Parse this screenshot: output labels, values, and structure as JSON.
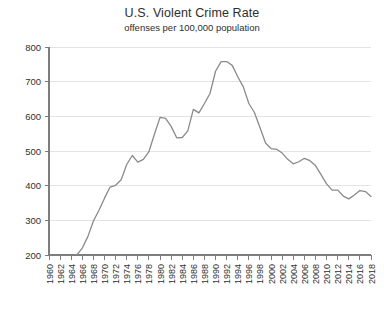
{
  "chart_data": {
    "type": "line",
    "title": "U.S. Violent Crime Rate",
    "subtitle": "offenses per 100,000 population",
    "xlabel": "",
    "ylabel": "",
    "ylim": [
      200,
      800
    ],
    "xlim": [
      1960,
      2018
    ],
    "grid": true,
    "legend": "none",
    "line_color": "#8a8a8a",
    "grid_color": "#e3e3e3",
    "axis_color": "#7d7d7d",
    "ytick_labels": [
      "800",
      "700",
      "600",
      "500",
      "400",
      "300",
      "200"
    ],
    "ytick_values": [
      800,
      700,
      600,
      500,
      400,
      300,
      200
    ],
    "xtick_labels": [
      "1960",
      "1962",
      "1964",
      "1966",
      "1968",
      "1970",
      "1972",
      "1974",
      "1976",
      "1978",
      "1980",
      "1982",
      "1984",
      "1986",
      "1988",
      "1990",
      "1992",
      "1994",
      "1996",
      "1998",
      "2000",
      "2002",
      "2004",
      "2006",
      "2008",
      "2010",
      "2012",
      "2014",
      "2016",
      "2018"
    ],
    "xtick_values": [
      1960,
      1962,
      1964,
      1966,
      1968,
      1970,
      1972,
      1974,
      1976,
      1978,
      1980,
      1982,
      1984,
      1986,
      1988,
      1990,
      1992,
      1994,
      1996,
      1998,
      2000,
      2002,
      2004,
      2006,
      2008,
      2010,
      2012,
      2014,
      2016,
      2018
    ],
    "x": [
      1960,
      1961,
      1962,
      1963,
      1964,
      1965,
      1966,
      1967,
      1968,
      1969,
      1970,
      1971,
      1972,
      1973,
      1974,
      1975,
      1976,
      1977,
      1978,
      1979,
      1980,
      1981,
      1982,
      1983,
      1984,
      1985,
      1986,
      1987,
      1988,
      1989,
      1990,
      1991,
      1992,
      1993,
      1994,
      1995,
      1996,
      1997,
      1998,
      1999,
      2000,
      2001,
      2002,
      2003,
      2004,
      2005,
      2006,
      2007,
      2008,
      2009,
      2010,
      2011,
      2012,
      2013,
      2014,
      2015,
      2016,
      2017,
      2018
    ],
    "values": [
      161,
      158,
      162,
      168,
      191,
      200,
      220,
      253,
      298,
      329,
      364,
      396,
      401,
      417,
      461,
      487,
      468,
      476,
      498,
      549,
      597,
      594,
      571,
      538,
      539,
      558,
      620,
      610,
      637,
      666,
      730,
      758,
      758,
      747,
      714,
      685,
      637,
      611,
      568,
      523,
      507,
      505,
      494,
      476,
      463,
      469,
      479,
      472,
      458,
      432,
      405,
      387,
      387,
      370,
      362,
      373,
      386,
      383,
      369
    ],
    "series_name": "U.S. violent crime rate",
    "notes": {
      "start_value_below_axis": true,
      "peak_year": 1991,
      "peak_value": 758,
      "local_peak_1980": 597,
      "local_min_1984": 538
    }
  },
  "plot_geometry": {
    "left": 49,
    "right": 371,
    "top": 47,
    "bottom": 255
  }
}
